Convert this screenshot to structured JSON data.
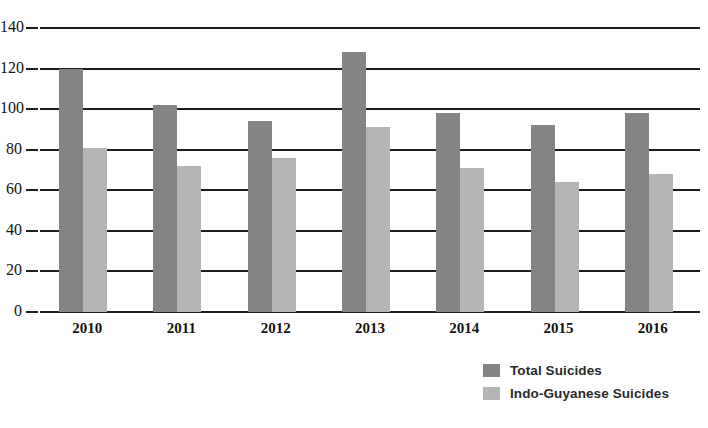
{
  "chart_data": {
    "type": "bar",
    "title": "",
    "subtitle": "",
    "xlabel": "",
    "ylabel": "",
    "categories": [
      "2010",
      "2011",
      "2012",
      "2013",
      "2014",
      "2015",
      "2016"
    ],
    "series": [
      {
        "name": "Total Suicides",
        "color": "#848484",
        "values": [
          120,
          102,
          94,
          128,
          98,
          92,
          98
        ]
      },
      {
        "name": "Indo-Guyanese Suicides",
        "color": "#b5b5b5",
        "values": [
          81,
          72,
          76,
          91,
          71,
          64,
          68
        ]
      }
    ],
    "ylim": [
      0,
      140
    ],
    "ytick_values": [
      0,
      20,
      40,
      60,
      80,
      100,
      120,
      140
    ],
    "ytick_labels": [
      "0",
      "20",
      "40",
      "60",
      "80",
      "100",
      "120",
      "140"
    ],
    "grid": true,
    "legend_position": "bottom-right"
  },
  "legend": {
    "entries": [
      {
        "label": "Total Suicides",
        "swatch": "total-suicides-swatch"
      },
      {
        "label": "Indo-Guyanese Suicides",
        "swatch": "indo-guyanese-suicides-swatch"
      }
    ]
  }
}
